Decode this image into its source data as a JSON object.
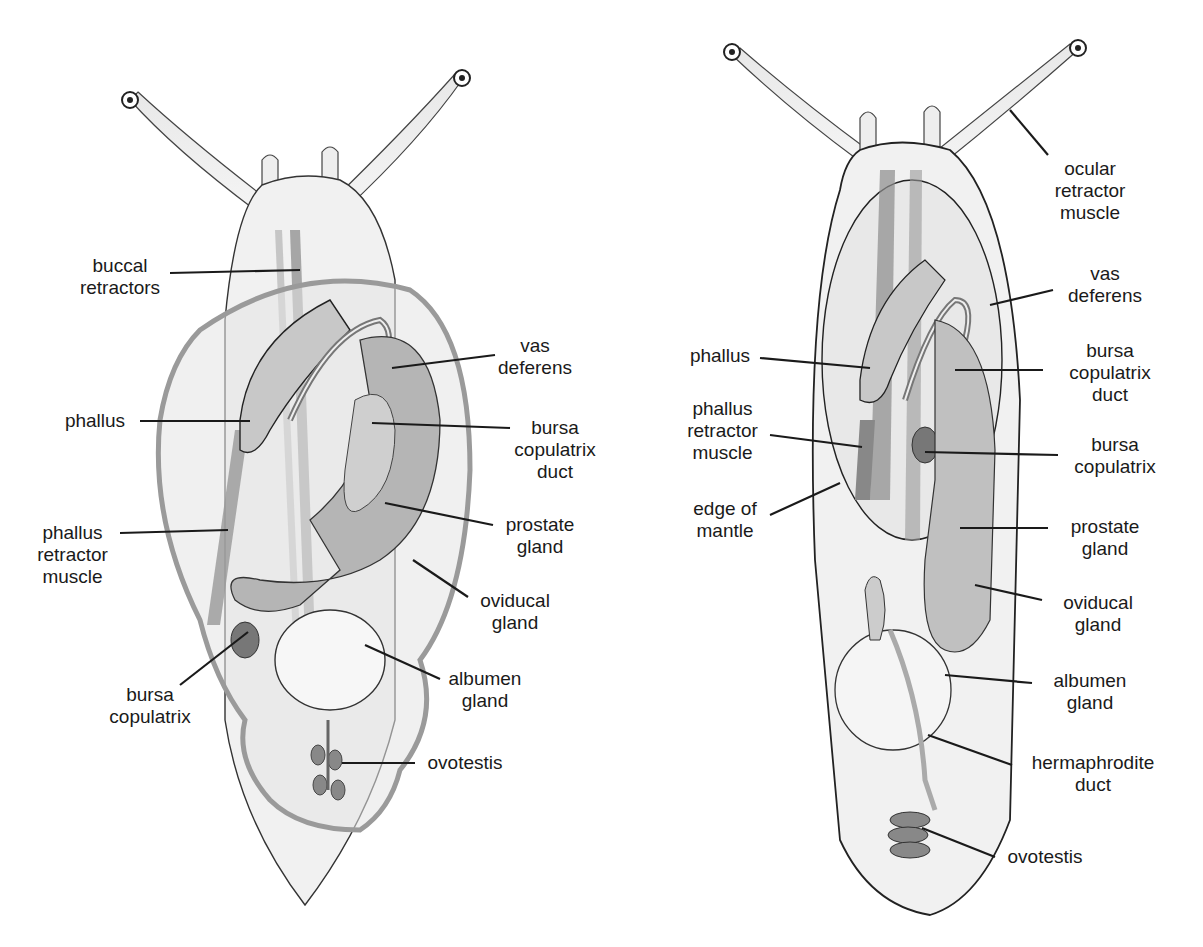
{
  "figure": {
    "left_panel": {
      "description": "Snail (shelled) with internal reproductive anatomy",
      "labels": [
        {
          "id": "buccal",
          "text": "buccal\nretractors"
        },
        {
          "id": "phallus",
          "text": "phallus"
        },
        {
          "id": "phallus_retractor",
          "text": "phallus\nretractor\nmuscle"
        },
        {
          "id": "bursa_copulatrix",
          "text": "bursa\ncopulatrix"
        },
        {
          "id": "vas_deferens",
          "text": "vas\ndeferens"
        },
        {
          "id": "bursa_duct",
          "text": "bursa\ncopulatrix\nduct"
        },
        {
          "id": "prostate",
          "text": "prostate\ngland"
        },
        {
          "id": "oviducal",
          "text": "oviducal\ngland"
        },
        {
          "id": "albumen",
          "text": "albumen\ngland"
        },
        {
          "id": "ovotestis",
          "text": "ovotestis"
        }
      ]
    },
    "right_panel": {
      "description": "Slug with internal reproductive anatomy",
      "labels": [
        {
          "id": "ocular",
          "text": "ocular\nretractor\nmuscle"
        },
        {
          "id": "vas_deferens",
          "text": "vas\ndeferens"
        },
        {
          "id": "phallus",
          "text": "phallus"
        },
        {
          "id": "bursa_duct",
          "text": "bursa\ncopulatrix\nduct"
        },
        {
          "id": "phallus_retractor",
          "text": "phallus\nretractor\nmuscle"
        },
        {
          "id": "bursa_copulatrix",
          "text": "bursa\ncopulatrix"
        },
        {
          "id": "edge_mantle",
          "text": "edge of\nmantle"
        },
        {
          "id": "prostate",
          "text": "prostate\ngland"
        },
        {
          "id": "oviducal",
          "text": "oviducal\ngland"
        },
        {
          "id": "albumen",
          "text": "albumen\ngland"
        },
        {
          "id": "hermaphrodite",
          "text": "hermaphrodite\nduct"
        },
        {
          "id": "ovotestis",
          "text": "ovotestis"
        }
      ]
    },
    "colors": {
      "body_fill": "#f1f1f1",
      "organ_mid": "#bdbdbd",
      "organ_dark": "#8c8c8c",
      "shell_stroke": "#9a9a9a",
      "line": "#1a1a1a"
    }
  }
}
